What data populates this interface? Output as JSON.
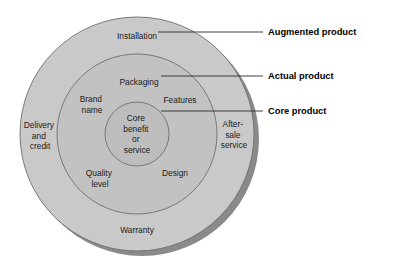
{
  "diagram": {
    "type": "concentric-circles",
    "colors": {
      "augmented_fill": "#c9c9c9",
      "actual_fill": "#c2c2c2",
      "core_fill": "#bdbdbd",
      "outline": "#6e6e6e",
      "shadow": "#8a8a8a",
      "text": "#1b1b1b",
      "callout_text": "#000000",
      "background": "#ffffff"
    },
    "rings": [
      {
        "id": "augmented",
        "callout": "Augmented product",
        "items": [
          {
            "id": "installation",
            "label": "Installation",
            "lines": [
              "Installation"
            ]
          },
          {
            "id": "delivery-and-credit",
            "label": "Delivery and credit",
            "lines": [
              "Delivery",
              "and",
              "credit"
            ]
          },
          {
            "id": "after-sale-service",
            "label": "After-sale service",
            "lines": [
              "After-",
              "sale",
              "service"
            ]
          },
          {
            "id": "warranty",
            "label": "Warranty",
            "lines": [
              "Warranty"
            ]
          }
        ]
      },
      {
        "id": "actual",
        "callout": "Actual product",
        "items": [
          {
            "id": "packaging",
            "label": "Packaging",
            "lines": [
              "Packaging"
            ]
          },
          {
            "id": "brand-name",
            "label": "Brand name",
            "lines": [
              "Brand",
              "name"
            ]
          },
          {
            "id": "features",
            "label": "Features",
            "lines": [
              "Features"
            ]
          },
          {
            "id": "quality-level",
            "label": "Quality level",
            "lines": [
              "Quality",
              "level"
            ]
          },
          {
            "id": "design",
            "label": "Design",
            "lines": [
              "Design"
            ]
          }
        ]
      },
      {
        "id": "core",
        "callout": "Core product",
        "items": [
          {
            "id": "core-benefit-or-service",
            "label": "Core benefit or service",
            "lines": [
              "Core",
              "benefit",
              "or",
              "service"
            ]
          }
        ]
      }
    ],
    "callouts": [
      {
        "id": "augmented-product",
        "label": "Augmented product"
      },
      {
        "id": "actual-product",
        "label": "Actual product"
      },
      {
        "id": "core-product",
        "label": "Core product"
      }
    ]
  }
}
